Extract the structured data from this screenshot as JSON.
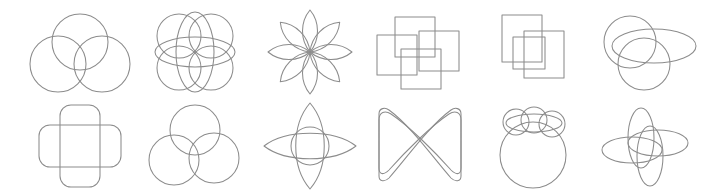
{
  "canvas": {
    "width": 701,
    "height": 196,
    "background_color": "#ffffff",
    "stroke_color": "#8c8c8c",
    "stroke_width": 1.05,
    "fill": "none",
    "style": "monoline geometric outline icon set",
    "columns": 6,
    "rows": 2,
    "icon_count": 12
  },
  "icons": [
    {
      "index": 1,
      "name": "three-circle-venn-icon",
      "description": "Three overlapping circles in triangular Venn arrangement",
      "row": 1,
      "column": 1,
      "x": 25,
      "y": 6,
      "primitive_count": 3,
      "primitives": [
        "circle",
        "circle",
        "circle"
      ]
    },
    {
      "index": 2,
      "name": "quad-circle-ellipse-grid-icon",
      "description": "Four circles in a two by two grid crossed by a vertical ellipse and a horizontal ellipse",
      "row": 1,
      "column": 2,
      "x": 140,
      "y": 6,
      "primitive_count": 6,
      "primitives": [
        "circle",
        "circle",
        "circle",
        "circle",
        "ellipse-vertical",
        "ellipse-horizontal"
      ]
    },
    {
      "index": 3,
      "name": "eight-petal-rosette-icon",
      "description": "Eight pointed lens petals radiating from a shared center forming a flower rosette",
      "row": 1,
      "column": 3,
      "x": 255,
      "y": 6,
      "primitive_count": 8,
      "primitives": [
        "petal",
        "petal",
        "petal",
        "petal",
        "petal",
        "petal",
        "petal",
        "petal"
      ]
    },
    {
      "index": 4,
      "name": "four-square-pinwheel-icon",
      "description": "Four equal squares interlocked in a rotational pinwheel arrangement",
      "row": 1,
      "column": 4,
      "x": 365,
      "y": 6,
      "primitive_count": 4,
      "primitives": [
        "square",
        "square",
        "square",
        "square"
      ]
    },
    {
      "index": 5,
      "name": "three-square-cascade-icon",
      "description": "Three squares overlapping in a staggered diagonal cascade",
      "row": 1,
      "column": 5,
      "x": 480,
      "y": 6,
      "primitive_count": 3,
      "primitives": [
        "square",
        "square",
        "square"
      ]
    },
    {
      "index": 6,
      "name": "two-circle-wide-ellipse-icon",
      "description": "Two overlapping circles crossed by a wide horizontal ellipse",
      "row": 1,
      "column": 6,
      "x": 592,
      "y": 6,
      "primitive_count": 3,
      "primitives": [
        "circle",
        "circle",
        "ellipse-horizontal"
      ]
    },
    {
      "index": 7,
      "name": "rounded-rect-cross-icon",
      "description": "A vertical rounded rectangle overlapping a horizontal rounded rectangle forming a plus cross",
      "row": 2,
      "column": 1,
      "x": 25,
      "y": 100,
      "primitive_count": 2,
      "primitives": [
        "rounded-rectangle-vertical",
        "rounded-rectangle-horizontal"
      ]
    },
    {
      "index": 8,
      "name": "three-circle-interlock-knot-icon",
      "description": "Three circles interwoven in a trefoil Borromean knot arrangement",
      "row": 2,
      "column": 2,
      "x": 140,
      "y": 100,
      "primitive_count": 3,
      "primitives": [
        "circle",
        "circle",
        "circle"
      ]
    },
    {
      "index": 9,
      "name": "four-point-lens-star-icon",
      "description": "A tall vertical lens crossed with a wide horizontal lens and a center circle forming a four pointed star",
      "row": 2,
      "column": 3,
      "x": 255,
      "y": 100,
      "primitive_count": 3,
      "primitives": [
        "lens-vertical",
        "lens-horizontal",
        "circle"
      ]
    },
    {
      "index": 10,
      "name": "bowtie-loop-icon",
      "description": "Two crossing curved ribbons forming a bowtie with a looped lens at the crossing point",
      "row": 2,
      "column": 4,
      "x": 365,
      "y": 100,
      "primitive_count": 2,
      "primitives": [
        "ribbon-curve",
        "ribbon-curve"
      ]
    },
    {
      "index": 11,
      "name": "circle-with-three-bubbles-icon",
      "description": "A large circle topped by three small circles crossed by a horizontal ellipse",
      "row": 2,
      "column": 5,
      "x": 480,
      "y": 100,
      "primitive_count": 5,
      "primitives": [
        "circle-large",
        "circle-small",
        "circle-small",
        "circle-small",
        "ellipse-horizontal"
      ]
    },
    {
      "index": 12,
      "name": "four-ellipse-rosette-icon",
      "description": "Four elongated ellipses crossing at a shared center forming a four lobed rosette",
      "row": 2,
      "column": 6,
      "x": 592,
      "y": 100,
      "primitive_count": 4,
      "primitives": [
        "ellipse-vertical",
        "ellipse-vertical",
        "ellipse-horizontal",
        "ellipse-horizontal"
      ]
    }
  ]
}
